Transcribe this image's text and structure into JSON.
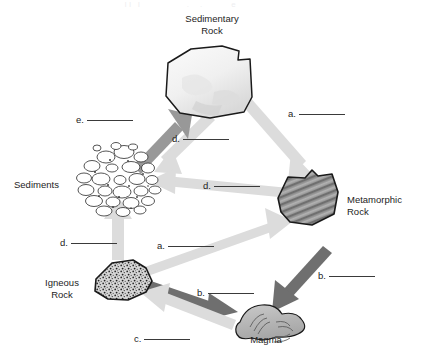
{
  "diagram": {
    "title_faint": "                                                        I I   I                     .     .             e",
    "type": "rock-cycle",
    "background": "#ffffff",
    "colors": {
      "arrow_dark": "#6e6e6e",
      "arrow_mid": "#8f8f8f",
      "arrow_light": "#d8d8d8",
      "rock_outline": "#1a1a1a",
      "sedimentary_fill": "#f2f2f2",
      "metamorphic_fill": "#8d8d8d",
      "igneous_fill": "#cfcfcf",
      "magma_fill": "#b5b5b5",
      "rule_color": "#3a3a3a",
      "text": "#1d1d1d"
    },
    "nodes": [
      {
        "id": "sedimentary-rock",
        "label": "Sedimentary\nRock",
        "x": 212,
        "y": 26
      },
      {
        "id": "sediments",
        "label": "Sediments",
        "x": 43,
        "y": 185
      },
      {
        "id": "metamorphic-rock",
        "label": "Metamorphic\nRock",
        "x": 360,
        "y": 200
      },
      {
        "id": "igneous-rock",
        "label": "Igneous\nRock",
        "x": 62,
        "y": 283
      },
      {
        "id": "magma",
        "label": "Magma",
        "x": 266,
        "y": 340
      }
    ],
    "blanks": [
      {
        "id": "blank-e-sediments-to-sedimentary",
        "letter": "e",
        "x": 76,
        "y": 114,
        "rule_width": 46
      },
      {
        "id": "blank-a-sedimentary-to-metamorphic",
        "letter": "a",
        "x": 288,
        "y": 108,
        "rule_width": 46
      },
      {
        "id": "blank-d-sedimentary-to-sediments",
        "letter": "d",
        "x": 172,
        "y": 133,
        "rule_width": 46
      },
      {
        "id": "blank-d-metamorphic-to-sediments",
        "letter": "d",
        "x": 203,
        "y": 180,
        "rule_width": 46
      },
      {
        "id": "blank-d-igneous-to-sediments",
        "letter": "d",
        "x": 60,
        "y": 237,
        "rule_width": 46
      },
      {
        "id": "blank-a-igneous-to-metamorphic",
        "letter": "a",
        "x": 157,
        "y": 240,
        "rule_width": 46
      },
      {
        "id": "blank-b-igneous-to-magma",
        "letter": "b",
        "x": 197,
        "y": 287,
        "rule_width": 46
      },
      {
        "id": "blank-b-metamorphic-to-magma",
        "letter": "b",
        "x": 318,
        "y": 270,
        "rule_width": 46
      },
      {
        "id": "blank-c-magma-to-igneous",
        "letter": "c",
        "x": 134,
        "y": 333,
        "rule_width": 46
      }
    ],
    "arrows": [
      {
        "id": "arrow-sediments-to-sedimentary",
        "from": "sediments",
        "to": "sedimentary-rock",
        "shade": "dark"
      },
      {
        "id": "arrow-sedimentary-to-sediments",
        "from": "sedimentary-rock",
        "to": "sediments",
        "shade": "light"
      },
      {
        "id": "arrow-sedimentary-to-metamorphic",
        "from": "sedimentary-rock",
        "to": "metamorphic-rock",
        "shade": "light"
      },
      {
        "id": "arrow-metamorphic-to-sediments",
        "from": "metamorphic-rock",
        "to": "sediments",
        "shade": "light"
      },
      {
        "id": "arrow-igneous-to-metamorphic",
        "from": "igneous-rock",
        "to": "metamorphic-rock",
        "shade": "light"
      },
      {
        "id": "arrow-igneous-to-sediments",
        "from": "igneous-rock",
        "to": "sediments",
        "shade": "light"
      },
      {
        "id": "arrow-igneous-to-magma",
        "from": "igneous-rock",
        "to": "magma",
        "shade": "dark"
      },
      {
        "id": "arrow-metamorphic-to-magma",
        "from": "metamorphic-rock",
        "to": "magma",
        "shade": "dark"
      },
      {
        "id": "arrow-magma-to-igneous",
        "from": "magma",
        "to": "igneous-rock",
        "shade": "light"
      }
    ]
  }
}
